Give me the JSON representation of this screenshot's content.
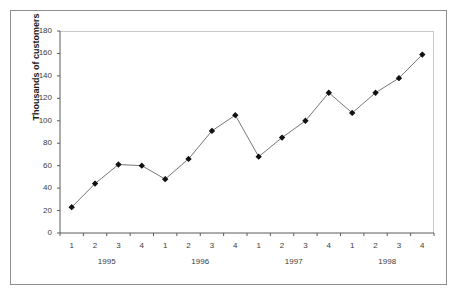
{
  "figure": {
    "title_remnant": "..........",
    "frame_color": "#8d8d8d",
    "plot_border_color": "#c9c9c9",
    "background": "#ffffff"
  },
  "chart_data": {
    "type": "line",
    "title": "",
    "xlabel": "",
    "ylabel": "Thousands of customers",
    "ylim": [
      0,
      180
    ],
    "yticks": [
      0,
      20,
      40,
      60,
      80,
      100,
      120,
      140,
      160,
      180
    ],
    "ytick_labels": [
      "0",
      "20",
      "40",
      "60",
      "80",
      "100",
      "120",
      "140",
      "160",
      "180"
    ],
    "grid": false,
    "legend": null,
    "marker": "filled-diamond",
    "line_color": "#555555",
    "marker_color": "#111111",
    "categories": [
      "1",
      "2",
      "3",
      "4",
      "1",
      "2",
      "3",
      "4",
      "1",
      "2",
      "3",
      "4",
      "1",
      "2",
      "3",
      "4"
    ],
    "group_labels": [
      "1995",
      "1996",
      "1997",
      "1998"
    ],
    "values": [
      23,
      44,
      61,
      60,
      48,
      66,
      91,
      105,
      68,
      85,
      100,
      125,
      107,
      125,
      138,
      159
    ],
    "points": [
      {
        "quarter": "1",
        "year": "1995",
        "value": 23
      },
      {
        "quarter": "2",
        "year": "1995",
        "value": 44
      },
      {
        "quarter": "3",
        "year": "1995",
        "value": 61
      },
      {
        "quarter": "4",
        "year": "1995",
        "value": 60
      },
      {
        "quarter": "1",
        "year": "1996",
        "value": 48
      },
      {
        "quarter": "2",
        "year": "1996",
        "value": 66
      },
      {
        "quarter": "3",
        "year": "1996",
        "value": 91
      },
      {
        "quarter": "4",
        "year": "1996",
        "value": 105
      },
      {
        "quarter": "1",
        "year": "1997",
        "value": 68
      },
      {
        "quarter": "2",
        "year": "1997",
        "value": 85
      },
      {
        "quarter": "3",
        "year": "1997",
        "value": 100
      },
      {
        "quarter": "4",
        "year": "1997",
        "value": 125
      },
      {
        "quarter": "1",
        "year": "1998",
        "value": 107
      },
      {
        "quarter": "2",
        "year": "1998",
        "value": 125
      },
      {
        "quarter": "3",
        "year": "1998",
        "value": 138
      },
      {
        "quarter": "4",
        "year": "1998",
        "value": 159
      }
    ]
  }
}
